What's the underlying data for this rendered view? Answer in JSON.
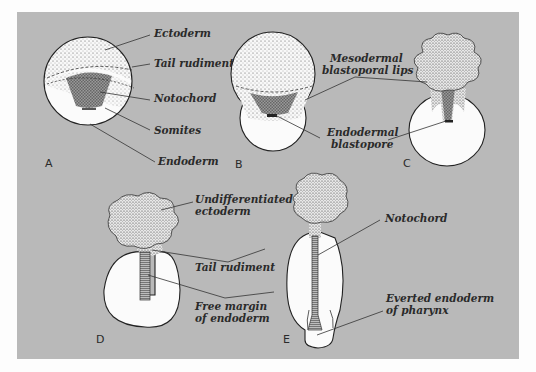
{
  "colors": {
    "background": "#fdfdfd",
    "panel": "#b9b9b9",
    "cell_fill": "#fbfbfb",
    "stipple": "#555555",
    "outline": "#222222"
  },
  "figures": [
    {
      "id": "A",
      "label": "A",
      "annotations": [
        "Ectoderm",
        "Tail rudiment",
        "Notochord",
        "Somites",
        "Endoderm"
      ]
    },
    {
      "id": "B",
      "label": "B",
      "annotations": []
    },
    {
      "id": "C",
      "label": "C",
      "annotations": []
    },
    {
      "id": "D",
      "label": "D",
      "annotations": []
    },
    {
      "id": "E",
      "label": "E",
      "annotations": []
    }
  ],
  "shared_labels": {
    "mesodermal_1": "Mesodermal",
    "mesodermal_2": "blastoporal lips",
    "endodermal_1": "Endodermal",
    "endodermal_2": "blastopore",
    "undiff_1": "Undifferentiated",
    "undiff_2": "ectoderm",
    "tail_rudiment": "Tail rudiment",
    "free_margin_1": "Free margin",
    "free_margin_2": "of endoderm",
    "notochord": "Notochord",
    "everted_1": "Everted endoderm",
    "everted_2": "of pharynx"
  }
}
